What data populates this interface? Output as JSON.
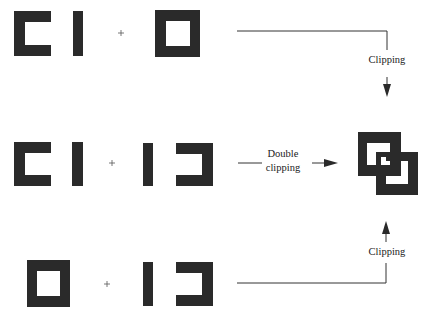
{
  "diagram": {
    "title": "",
    "rows": [
      {
        "operands": [
          "bracket-pair",
          "hollow-square"
        ],
        "operator": "+",
        "operation_label": "Clipping"
      },
      {
        "operands": [
          "bracket-pair",
          "mirrored-bracket-pair"
        ],
        "operator": "+",
        "operation_label_line1": "Double",
        "operation_label_line2": "clipping"
      },
      {
        "operands": [
          "hollow-square",
          "mirrored-bracket-pair"
        ],
        "operator": "+",
        "operation_label": "Clipping"
      }
    ],
    "result": "interlocked-squares",
    "colors": {
      "shape_fill": "#2a2a2a",
      "background": "#ffffff",
      "line": "#333333"
    }
  }
}
